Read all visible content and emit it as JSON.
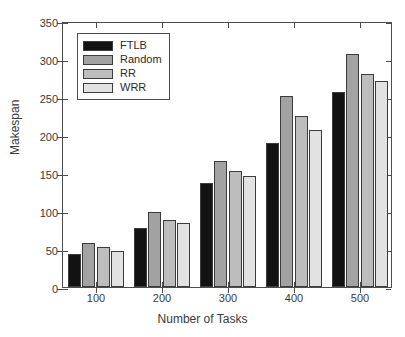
{
  "chart_data": {
    "type": "bar",
    "title": "",
    "xlabel": "Number of Tasks",
    "ylabel": "Makespan",
    "categories": [
      "100",
      "200",
      "300",
      "400",
      "500"
    ],
    "series": [
      {
        "name": "FTLB",
        "color": "#121212",
        "values": [
          43,
          78,
          137,
          190,
          257
        ]
      },
      {
        "name": "Random",
        "color": "#a2a2a2",
        "values": [
          58,
          99,
          166,
          251,
          307
        ]
      },
      {
        "name": "RR",
        "color": "#bdbdbd",
        "values": [
          52,
          88,
          153,
          225,
          280
        ]
      },
      {
        "name": "WRR",
        "color": "#e2e2e2",
        "values": [
          48,
          84,
          146,
          206,
          271
        ]
      }
    ],
    "ylim": [
      0,
      350
    ],
    "yticks": [
      0,
      50,
      100,
      150,
      200,
      250,
      300,
      350
    ],
    "ytick_labels": [
      "0",
      "50",
      "100",
      "150",
      "200",
      "250",
      "300",
      "350"
    ],
    "grid": false,
    "legend_position": "upper-left",
    "axis_color": "#4d4d4d",
    "background": "#ffffff"
  }
}
